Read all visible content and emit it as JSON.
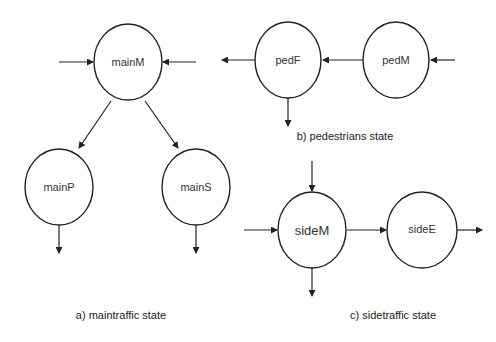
{
  "diagram": {
    "panels": {
      "a": {
        "caption": "a) maintraffic state",
        "states": [
          "mainM",
          "mainP",
          "mainS"
        ]
      },
      "b": {
        "caption": "b) pedestrians state",
        "states": [
          "pedF",
          "pedM"
        ]
      },
      "c": {
        "caption": "c) sidetraffic state",
        "states": [
          "sideM",
          "sideE"
        ]
      }
    },
    "states": {
      "mainM": "mainM",
      "mainP": "mainP",
      "mainS": "mainS",
      "pedF": "pedF",
      "pedM": "pedM",
      "sideM": "sideM",
      "sideE": "sideE"
    },
    "transitions": [
      {
        "from": "external",
        "to": "mainM"
      },
      {
        "from": "external",
        "to": "mainM"
      },
      {
        "from": "mainM",
        "to": "mainP"
      },
      {
        "from": "mainM",
        "to": "mainS"
      },
      {
        "from": "mainP",
        "to": "external"
      },
      {
        "from": "mainS",
        "to": "external"
      },
      {
        "from": "external",
        "to": "pedM"
      },
      {
        "from": "pedM",
        "to": "pedF"
      },
      {
        "from": "pedF",
        "to": "external"
      },
      {
        "from": "pedF",
        "to": "external"
      },
      {
        "from": "external",
        "to": "sideM"
      },
      {
        "from": "external",
        "to": "sideM"
      },
      {
        "from": "sideM",
        "to": "sideE"
      },
      {
        "from": "sideM",
        "to": "external"
      },
      {
        "from": "sideE",
        "to": "external"
      }
    ],
    "colors": {
      "stroke": "#222222",
      "background": "#ffffff"
    }
  }
}
